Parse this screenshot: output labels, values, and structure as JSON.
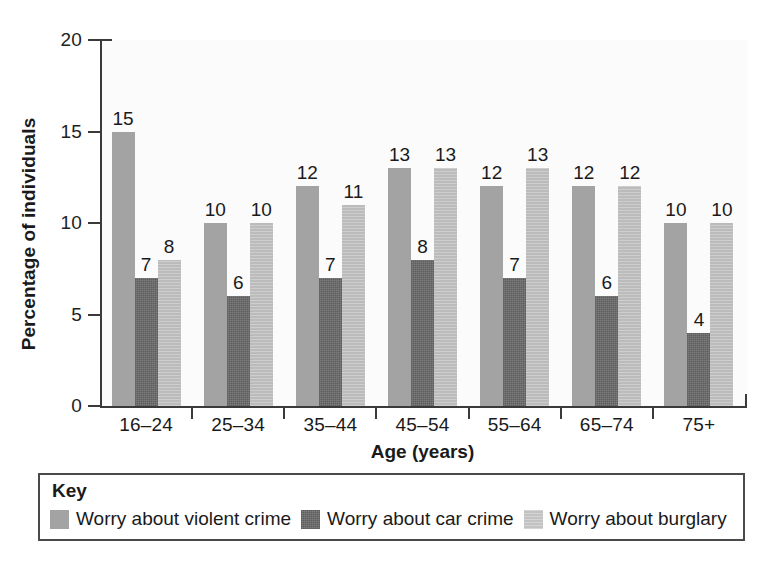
{
  "chart_data": {
    "type": "bar",
    "title": "",
    "xlabel": "Age (years)",
    "ylabel": "Percentage of individuals",
    "categories": [
      "16–24",
      "25–34",
      "35–44",
      "45–54",
      "55–64",
      "65–74",
      "75+"
    ],
    "series": [
      {
        "name": "Worry about violent crime",
        "color": "#a3a3a3",
        "values": [
          15,
          10,
          12,
          13,
          12,
          12,
          10
        ]
      },
      {
        "name": "Worry about car crime",
        "color": "#6d6d6d",
        "values": [
          7,
          6,
          7,
          8,
          7,
          6,
          4
        ]
      },
      {
        "name": "Worry about burglary",
        "color": "#bfbfbf",
        "values": [
          8,
          10,
          11,
          13,
          13,
          12,
          10
        ]
      }
    ],
    "ylim": [
      0,
      20
    ],
    "yticks": [
      0,
      5,
      10,
      15,
      20
    ],
    "ytick_labels": [
      "0",
      "5",
      "10",
      "15",
      "20"
    ],
    "grid": false,
    "data_labels": true,
    "legend_position": "below-plot"
  },
  "legend": {
    "title": "Key",
    "items": [
      {
        "label": "Worry about violent crime",
        "swatch": "violent"
      },
      {
        "label": "Worry about car crime",
        "swatch": "car"
      },
      {
        "label": "Worry about burglary",
        "swatch": "burglary"
      }
    ]
  }
}
